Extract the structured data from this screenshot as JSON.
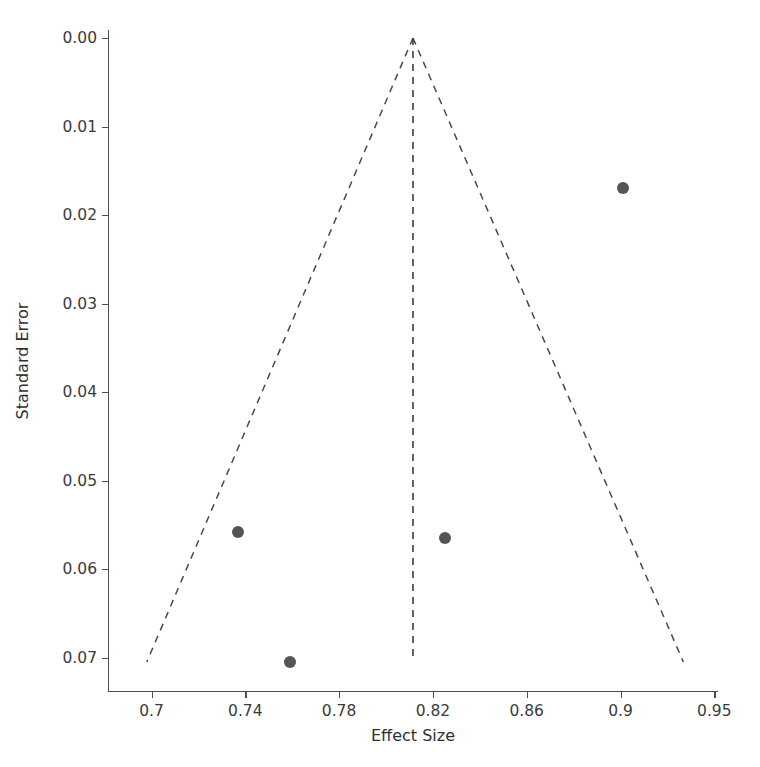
{
  "chart_data": {
    "type": "scatter",
    "title": "",
    "xlabel": "Effect Size",
    "ylabel": "Standard Error",
    "grid": false,
    "legend": false,
    "xticks": [
      0.7,
      0.74,
      0.78,
      0.82,
      0.86,
      0.9,
      0.95
    ],
    "xticklabels": [
      "0.7",
      "0.74",
      "0.78",
      "0.82",
      "0.86",
      "0.9",
      "0.95"
    ],
    "yticks": [
      0.0,
      0.01,
      0.02,
      0.03,
      0.04,
      0.05,
      0.06,
      0.07
    ],
    "yticklabels": [
      "0.00",
      "0.01",
      "0.02",
      "0.03",
      "0.04",
      "0.05",
      "0.06",
      "0.07"
    ],
    "xlim": [
      0.6825,
      0.9675
    ],
    "ylim": [
      -0.0009,
      0.0751
    ],
    "y_axis_inverted": true,
    "points": [
      {
        "x": 0.9015,
        "y": 0.017
      },
      {
        "x": 0.737,
        "y": 0.0558
      },
      {
        "x": 0.825,
        "y": 0.0565
      },
      {
        "x": 0.759,
        "y": 0.0705
      }
    ],
    "marker": {
      "shape": "circle",
      "color": "#555555",
      "size_px": 12
    },
    "funnel": {
      "center_effect": 0.8115,
      "apex_se": 0.0,
      "max_se": 0.0705,
      "left_leg_end_x": 0.698,
      "right_leg_end_x": 0.9335,
      "line_style": "dashed",
      "line_color": "#4a4a4a"
    },
    "series": [
      {
        "name": "studies",
        "x": [
          0.9015,
          0.737,
          0.825,
          0.759
        ],
        "values": [
          0.017,
          0.0558,
          0.0565,
          0.0705
        ]
      }
    ]
  }
}
